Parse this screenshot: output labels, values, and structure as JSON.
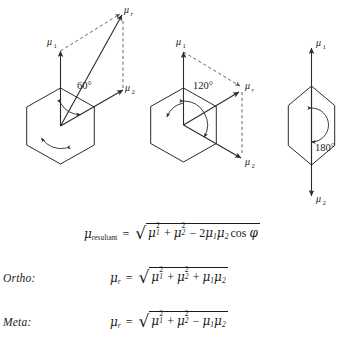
{
  "figure": {
    "stroke_color": "#2b2b2b",
    "dash_color": "#555555",
    "diagrams": [
      {
        "name": "ortho-60-degrees",
        "angle_label": "60°",
        "angle_value": 60,
        "vectors": [
          {
            "name": "mu1",
            "label": "μ",
            "sub": "1",
            "direction": "up"
          },
          {
            "name": "mu2",
            "label": "μ",
            "sub": "2",
            "direction": "up-right-60"
          },
          {
            "name": "mur",
            "label": "μ",
            "sub": "r",
            "direction": "resultant"
          }
        ]
      },
      {
        "name": "meta-120-degrees",
        "angle_label": "120°",
        "angle_value": 120,
        "vectors": [
          {
            "name": "mu1",
            "label": "μ",
            "sub": "1",
            "direction": "up"
          },
          {
            "name": "mu2",
            "label": "μ",
            "sub": "2",
            "direction": "down-right-120"
          },
          {
            "name": "mur",
            "label": "μ",
            "sub": "r",
            "direction": "resultant"
          }
        ]
      },
      {
        "name": "para-180-degrees",
        "angle_label": "180°",
        "angle_value": 180,
        "vectors": [
          {
            "name": "mu1",
            "label": "μ",
            "sub": "1",
            "direction": "up"
          },
          {
            "name": "mu2",
            "label": "μ",
            "sub": "2",
            "direction": "down"
          }
        ]
      }
    ]
  },
  "equations": [
    {
      "name": "general-resultant",
      "tag": "",
      "lhs_symbol": "μ",
      "lhs_sub": "resultant",
      "equals": "=",
      "radicand": "μ₁² + μ₂² − 2μ₁μ₂ cos φ",
      "terms": {
        "t1_sym": "μ",
        "t1_sub": "1",
        "t1_sup": "2",
        "op1": "+",
        "t2_sym": "μ",
        "t2_sub": "2",
        "t2_sup": "2",
        "op2": "−",
        "coef": "2",
        "t3_sym": "μ",
        "t3_sub": "1",
        "t4_sym": "μ",
        "t4_sub": "2",
        "trig": "cos",
        "angle_sym": "φ"
      }
    },
    {
      "name": "ortho-resultant",
      "tag": "Ortho:",
      "lhs_symbol": "μ",
      "lhs_sub": "r",
      "equals": "=",
      "radicand": "μ₁² + μ₂² + μ₁μ₂",
      "terms": {
        "t1_sym": "μ",
        "t1_sub": "1",
        "t1_sup": "2",
        "op1": "+",
        "t2_sym": "μ",
        "t2_sub": "2",
        "t2_sup": "2",
        "op2": "+",
        "t3_sym": "μ",
        "t3_sub": "1",
        "t4_sym": "μ",
        "t4_sub": "2"
      }
    },
    {
      "name": "meta-resultant",
      "tag": "Meta:",
      "lhs_symbol": "μ",
      "lhs_sub": "r",
      "equals": "=",
      "radicand": "μ₁² + μ₂² − μ₁μ₂",
      "terms": {
        "t1_sym": "μ",
        "t1_sub": "1",
        "t1_sup": "2",
        "op1": "+",
        "t2_sym": "μ",
        "t2_sub": "2",
        "t2_sup": "2",
        "op2": "−",
        "t3_sym": "μ",
        "t3_sub": "1",
        "t4_sym": "μ",
        "t4_sub": "2"
      }
    }
  ]
}
